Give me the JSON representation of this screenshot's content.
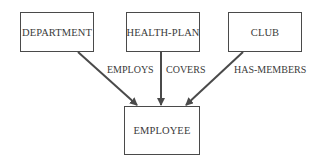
{
  "diagram": {
    "type": "entity-relationship",
    "entities": [
      {
        "id": "department",
        "label": "DEPARTMENT"
      },
      {
        "id": "health_plan",
        "label": "HEALTH-PLAN"
      },
      {
        "id": "club",
        "label": "CLUB"
      },
      {
        "id": "employee",
        "label": "EMPLOYEE"
      }
    ],
    "relationships": [
      {
        "from": "department",
        "to": "employee",
        "label": "EMPLOYS"
      },
      {
        "from": "health_plan",
        "to": "employee",
        "label": "COVERS"
      },
      {
        "from": "club",
        "to": "employee",
        "label": "HAS-MEMBERS"
      }
    ],
    "colors": {
      "line": "#4a4a4a",
      "text": "#3a3a3a",
      "background": "#ffffff"
    }
  }
}
